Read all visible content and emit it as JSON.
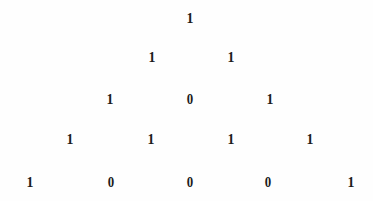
{
  "figure": {
    "kind": "pascal-triangle-mod-2",
    "background_color": "#fefefe",
    "ink_color": "#1b1b1b",
    "row_count": 5,
    "row_spacing_px": 41,
    "column_spacing_px": 80,
    "rows": [
      {
        "index": 1,
        "y": 18,
        "cells": [
          {
            "value": "1",
            "x": 190
          }
        ]
      },
      {
        "index": 2,
        "y": 57,
        "cells": [
          {
            "value": "1",
            "x": 152
          },
          {
            "value": "1",
            "x": 231
          }
        ]
      },
      {
        "index": 3,
        "y": 99,
        "cells": [
          {
            "value": "1",
            "x": 110
          },
          {
            "value": "0",
            "x": 190
          },
          {
            "value": "1",
            "x": 270
          }
        ]
      },
      {
        "index": 4,
        "y": 139,
        "cells": [
          {
            "value": "1",
            "x": 70
          },
          {
            "value": "1",
            "x": 151
          },
          {
            "value": "1",
            "x": 231
          },
          {
            "value": "1",
            "x": 310
          }
        ]
      },
      {
        "index": 5,
        "y": 182,
        "cells": [
          {
            "value": "1",
            "x": 30
          },
          {
            "value": "0",
            "x": 111
          },
          {
            "value": "0",
            "x": 190
          },
          {
            "value": "0",
            "x": 268
          },
          {
            "value": "1",
            "x": 351
          }
        ]
      }
    ]
  }
}
